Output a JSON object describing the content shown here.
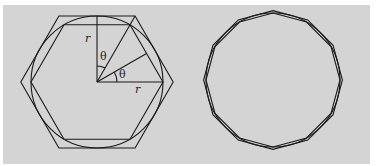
{
  "figure": {
    "background": "#d4d4d4",
    "stroke": "#1a1a1a",
    "left": {
      "description": "Circle of radius r with inscribed and circumscribed hexagons",
      "labels": {
        "radius_vertical": "r",
        "theta_upper": "θ",
        "theta_lower": "θ",
        "radius_horizontal": "r"
      }
    },
    "right": {
      "description": "Circle with inscribed and circumscribed dodecagons"
    }
  }
}
